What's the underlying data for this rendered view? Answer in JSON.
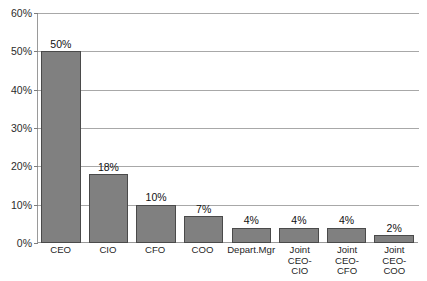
{
  "chart_data": {
    "type": "bar",
    "title": "",
    "subtitle": "",
    "xlabel": "",
    "ylabel": "",
    "categories": [
      "CEO",
      "CIO",
      "CFO",
      "COO",
      "Depart.Mgr",
      "Joint CEO-CIO",
      "Joint CEO-CFO",
      "Joint CEO-COO"
    ],
    "category_label_lines": [
      [
        "CEO"
      ],
      [
        "CIO"
      ],
      [
        "CFO"
      ],
      [
        "COO"
      ],
      [
        "Depart.Mgr"
      ],
      [
        "Joint CEO-",
        "CIO"
      ],
      [
        "Joint CEO-",
        "CFO"
      ],
      [
        "Joint CEO-",
        "COO"
      ]
    ],
    "values": [
      50,
      18,
      10,
      7,
      4,
      4,
      4,
      2
    ],
    "data_labels": [
      "50%",
      "18%",
      "10%",
      "7%",
      "4%",
      "4%",
      "4%",
      "2%"
    ],
    "ylim": [
      0,
      60
    ],
    "ytick_values": [
      0,
      10,
      20,
      30,
      40,
      50,
      60
    ],
    "ytick_labels": [
      "0%",
      "10%",
      "20%",
      "30%",
      "40%",
      "50%",
      "60%"
    ],
    "grid": true,
    "grid_axis": "y",
    "legend": false,
    "legend_position": "none",
    "bar_color": "#808080",
    "bar_edge_color": "#4a4a4a",
    "gridline_color": "#a8a8a8",
    "axis_color": "#9a9a9a",
    "background": "#ffffff"
  }
}
